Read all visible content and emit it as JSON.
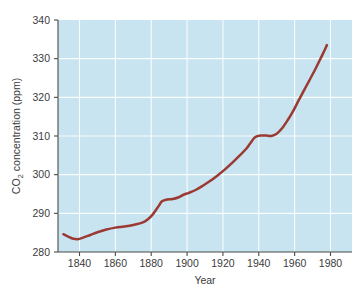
{
  "chart_data": {
    "type": "line",
    "title": "",
    "xlabel": "Year",
    "ylabel": "CO2 concentration (ppm)",
    "ylabel_parts": {
      "co": "CO",
      "sub": "2",
      "rest": " concentration (ppm)"
    },
    "xlim": [
      1828,
      1992
    ],
    "ylim": [
      280,
      340
    ],
    "xticks": [
      1840,
      1860,
      1880,
      1900,
      1920,
      1940,
      1960,
      1980
    ],
    "xtick_labels": [
      "1840",
      "1860",
      "1880",
      "1900",
      "1920",
      "1940",
      "1960",
      "1980"
    ],
    "yticks": [
      280,
      290,
      300,
      310,
      320,
      330,
      340
    ],
    "ytick_labels": [
      "280",
      "290",
      "300",
      "310",
      "320",
      "330",
      "340"
    ],
    "grid": true,
    "legend": "none",
    "series": [
      {
        "name": "CO2 concentration",
        "color": "#9b3a32",
        "x": [
          1831,
          1834,
          1836,
          1839,
          1842,
          1846,
          1850,
          1855,
          1860,
          1865,
          1870,
          1875,
          1878,
          1881,
          1884,
          1886,
          1889,
          1892,
          1895,
          1898,
          1901,
          1905,
          1909,
          1913,
          1917,
          1921,
          1925,
          1929,
          1933,
          1936,
          1938,
          1941,
          1944,
          1947,
          1950,
          1953,
          1956,
          1959,
          1962,
          1965,
          1968,
          1971,
          1974,
          1976,
          1978
        ],
        "values": [
          284.6,
          283.9,
          283.5,
          283.3,
          283.7,
          284.4,
          285.1,
          285.8,
          286.3,
          286.6,
          287.0,
          287.6,
          288.4,
          289.8,
          291.8,
          293.1,
          293.6,
          293.7,
          294.1,
          294.8,
          295.3,
          296.1,
          297.2,
          298.4,
          299.8,
          301.3,
          303.0,
          304.8,
          306.7,
          308.6,
          309.7,
          310.1,
          310.1,
          310.0,
          310.6,
          312.0,
          314.0,
          316.3,
          319.0,
          321.6,
          324.2,
          326.8,
          329.6,
          331.5,
          333.5
        ]
      }
    ],
    "colors": {
      "plot_background": "#c8e4f0",
      "gridline": "#ffffff",
      "axis": "#4a4a4a",
      "line": "#9b3a32",
      "text": "#3b3b3b",
      "figure_background": "#ffffff"
    },
    "layout": {
      "plot_left": 58,
      "plot_right": 352,
      "plot_top": 20,
      "plot_bottom": 252
    }
  }
}
